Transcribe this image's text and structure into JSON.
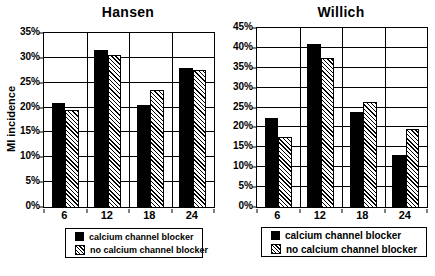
{
  "chart_data": [
    {
      "type": "bar",
      "title": "Hansen",
      "ylabel": "MI incidence",
      "xlabel": "",
      "categories": [
        "6",
        "12",
        "18",
        "24"
      ],
      "series": [
        {
          "name": "calcium channel blocker",
          "pattern": "solid-black",
          "values": [
            21,
            31.5,
            20.5,
            28
          ]
        },
        {
          "name": "no calcium channel blocker",
          "pattern": "diagonal-hatch",
          "values": [
            19.5,
            30.5,
            23.5,
            27.5
          ]
        }
      ],
      "ylim": [
        0,
        35
      ],
      "ytick_step": 5,
      "ytick_suffix": "%",
      "grid": true,
      "legend_position": "bottom"
    },
    {
      "type": "bar",
      "title": "Willich",
      "ylabel": "",
      "xlabel": "",
      "categories": [
        "6",
        "12",
        "18",
        "24"
      ],
      "series": [
        {
          "name": "calcium channel blocker",
          "pattern": "solid-black",
          "values": [
            22.5,
            41,
            24,
            13
          ]
        },
        {
          "name": "no calcium channel blocker",
          "pattern": "diagonal-hatch",
          "values": [
            17.5,
            37.5,
            26.5,
            19.5
          ]
        }
      ],
      "ylim": [
        0,
        45
      ],
      "ytick_step": 5,
      "ytick_suffix": "%",
      "grid": true,
      "legend_position": "bottom"
    }
  ],
  "colors": {
    "foreground": "#000000",
    "background": "#ffffff"
  }
}
